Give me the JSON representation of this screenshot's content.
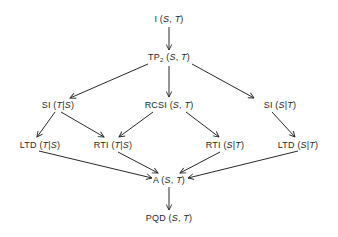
{
  "diagram": {
    "type": "directed-implication-graph",
    "colors": {
      "line": "#2a2a2a",
      "text": "#2a2a2a",
      "background": "#ffffff"
    },
    "nodes": [
      {
        "id": "I",
        "prefix": "I",
        "sub": "",
        "args": "S, T",
        "sep": ",",
        "a": "S",
        "b": "T",
        "x": 169,
        "y": 19
      },
      {
        "id": "TP2",
        "prefix": "TP",
        "sub": "2",
        "args": "S, T",
        "sep": ",",
        "a": "S",
        "b": "T",
        "x": 169,
        "y": 58
      },
      {
        "id": "SI_TS",
        "prefix": "SI",
        "sub": "",
        "args": "T|S",
        "sep": "|",
        "a": "T",
        "b": "S",
        "x": 58,
        "y": 105
      },
      {
        "id": "RCSI",
        "prefix": "RCSI",
        "sub": "",
        "args": "S, T",
        "sep": ",",
        "a": "S",
        "b": "T",
        "x": 169,
        "y": 105
      },
      {
        "id": "SI_ST",
        "prefix": "SI",
        "sub": "",
        "args": "S|T",
        "sep": "|",
        "a": "S",
        "b": "T",
        "x": 280,
        "y": 105
      },
      {
        "id": "LTD_TS",
        "prefix": "LTD",
        "sub": "",
        "args": "T|S",
        "sep": "|",
        "a": "T",
        "b": "S",
        "x": 40,
        "y": 145
      },
      {
        "id": "RTI_TS",
        "prefix": "RTI",
        "sub": "",
        "args": "T|S",
        "sep": "|",
        "a": "T",
        "b": "S",
        "x": 113,
        "y": 145
      },
      {
        "id": "RTI_ST",
        "prefix": "RTI",
        "sub": "",
        "args": "S|T",
        "sep": "|",
        "a": "S",
        "b": "T",
        "x": 225,
        "y": 145
      },
      {
        "id": "LTD_ST",
        "prefix": "LTD",
        "sub": "",
        "args": "S|T",
        "sep": "|",
        "a": "S",
        "b": "T",
        "x": 298,
        "y": 145
      },
      {
        "id": "A",
        "prefix": "A",
        "sub": "",
        "args": "S, T",
        "sep": ",",
        "a": "S",
        "b": "T",
        "x": 169,
        "y": 180
      },
      {
        "id": "PQD",
        "prefix": "PQD",
        "sub": "",
        "args": "S, T",
        "sep": ",",
        "a": "S",
        "b": "T",
        "x": 169,
        "y": 218
      }
    ],
    "edges": [
      {
        "from": "I",
        "to": "TP2",
        "x1": 169,
        "y1": 27,
        "x2": 169,
        "y2": 50
      },
      {
        "from": "TP2",
        "to": "SI_TS",
        "x1": 148,
        "y1": 64,
        "x2": 70,
        "y2": 98
      },
      {
        "from": "TP2",
        "to": "RCSI",
        "x1": 169,
        "y1": 66,
        "x2": 169,
        "y2": 97
      },
      {
        "from": "TP2",
        "to": "SI_ST",
        "x1": 192,
        "y1": 64,
        "x2": 254,
        "y2": 98
      },
      {
        "from": "SI_TS",
        "to": "LTD_TS",
        "x1": 55,
        "y1": 112,
        "x2": 37,
        "y2": 137
      },
      {
        "from": "SI_TS",
        "to": "RTI_TS",
        "x1": 61,
        "y1": 112,
        "x2": 104,
        "y2": 137
      },
      {
        "from": "RCSI",
        "to": "RTI_TS",
        "x1": 153,
        "y1": 112,
        "x2": 119,
        "y2": 137
      },
      {
        "from": "RCSI",
        "to": "RTI_ST",
        "x1": 186,
        "y1": 112,
        "x2": 219,
        "y2": 137
      },
      {
        "from": "SI_ST",
        "to": "LTD_ST",
        "x1": 272,
        "y1": 112,
        "x2": 295,
        "y2": 137
      },
      {
        "from": "LTD_TS",
        "to": "A",
        "x1": 39,
        "y1": 151,
        "x2": 152,
        "y2": 178
      },
      {
        "from": "RTI_TS",
        "to": "A",
        "x1": 118,
        "y1": 152,
        "x2": 158,
        "y2": 173
      },
      {
        "from": "RTI_ST",
        "to": "A",
        "x1": 220,
        "y1": 152,
        "x2": 180,
        "y2": 173
      },
      {
        "from": "LTD_ST",
        "to": "A",
        "x1": 298,
        "y1": 151,
        "x2": 188,
        "y2": 178
      },
      {
        "from": "A",
        "to": "PQD",
        "x1": 169,
        "y1": 187,
        "x2": 169,
        "y2": 210
      }
    ]
  }
}
